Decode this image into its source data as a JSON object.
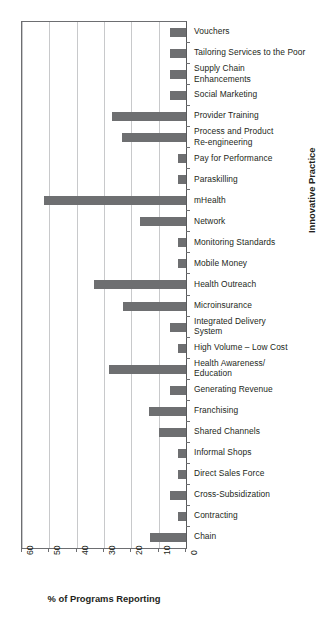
{
  "chart_data": {
    "type": "bar",
    "orientation": "horizontal",
    "title": "",
    "xlabel": "% of Programs Reporting",
    "ylabel": "Innovative Practice",
    "xlim": [
      0,
      60
    ],
    "x_reversed": true,
    "xticks": [
      60,
      50,
      40,
      30,
      20,
      10,
      0
    ],
    "xtick_labels": [
      "60",
      "50",
      "40",
      "30",
      "20",
      "10",
      "0"
    ],
    "grid": true,
    "grid_axis": "x",
    "legend": "none",
    "bar_color": "#6e6f71",
    "categories": [
      "Vouchers",
      "Tailoring Services to the Poor",
      "Supply Chain\nEnhancements",
      "Social Marketing",
      "Provider Training",
      "Process and Product\nRe-engineering",
      "Pay for Performance",
      "Paraskilling",
      "mHealth",
      "Network",
      "Monitoring Standards",
      "Mobile Money",
      "Health Outreach",
      "Microinsurance",
      "Integrated Delivery\nSystem",
      "High Volume – Low Cost",
      "Health Awareness/\nEducation",
      "Generating Revenue",
      "Franchising",
      "Shared Channels",
      "Informal Shops",
      "Direct Sales Force",
      "Cross-Subsidization",
      "Contracting",
      "Chain"
    ],
    "values": [
      6,
      6,
      6,
      6,
      27,
      23.5,
      3,
      3,
      52,
      17,
      3,
      3,
      33.5,
      23,
      6,
      3,
      28,
      6,
      13.5,
      10,
      3,
      3,
      6,
      3,
      13
    ]
  },
  "axes": {
    "x_title": "% of Programs Reporting",
    "y_title": "Innovative Practice"
  }
}
